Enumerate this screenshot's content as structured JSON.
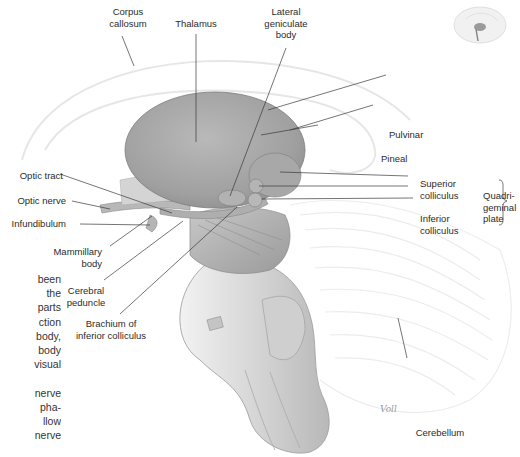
{
  "figure": {
    "type": "anatomical-illustration",
    "thumbnail": "brain-midsagittal-locator-icon",
    "signature": "Voll"
  },
  "labels": {
    "corpus_callosum": [
      "Corpus",
      "callosum"
    ],
    "thalamus": "Thalamus",
    "lateral_geniculate_body": [
      "Lateral",
      "geniculate",
      "body"
    ],
    "pulvinar": "Pulvinar",
    "pineal": "Pineal",
    "superior_colliculus": [
      "Superior",
      "colliculus"
    ],
    "inferior_colliculus": [
      "Inferior",
      "colliculus"
    ],
    "quadrigeminal_plate": [
      "Quadri-",
      "geminal",
      "plate"
    ],
    "optic_tract": "Optic tract",
    "optic_nerve": "Optic nerve",
    "infundibulum": "Infundibulum",
    "mammillary_body": [
      "Mammillary",
      "body"
    ],
    "cerebral_peduncle": [
      "Cerebral",
      "peduncle"
    ],
    "brachium_inferior_colliculus": [
      "Brachium of",
      "inferior colliculus"
    ],
    "cerebellum": "Cerebellum"
  },
  "side_text": {
    "lines": [
      "been",
      "the",
      "parts",
      "ction",
      "body,",
      "body",
      "visual",
      "",
      "nerve",
      "pha-",
      "llow",
      "nerve"
    ]
  },
  "colors": {
    "background": "#ffffff",
    "leader_line": "#3a3a3a",
    "label_text": "#2b2b2b",
    "thalamus_fill": "#a6a6a6",
    "brainstem_fill": "#d9d9d9",
    "outline_faint": "#e3e3e3"
  }
}
